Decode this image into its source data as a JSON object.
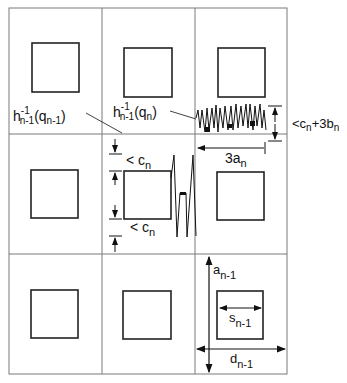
{
  "diagram": {
    "grid": {
      "rows": 3,
      "cols": 3,
      "line_color": "#7a7a7a",
      "square_color": "#222222"
    },
    "labels": {
      "h_prev": {
        "base": "h",
        "sup": "-1",
        "sub": "n-1",
        "arg": "(q",
        "arg_sub": "n-1",
        "close": ")"
      },
      "h_curr": {
        "base": "h",
        "sup": "-1",
        "sub": "n-1",
        "arg": "(q",
        "arg_sub": "n",
        "close": ")"
      },
      "height_bound": {
        "prefix": "<c",
        "sub1": "n",
        "mid": "+3b",
        "sub2": "n"
      },
      "width_3a": {
        "main": "3a",
        "sub": "n"
      },
      "cn_top": {
        "main": "< c",
        "sub": "n"
      },
      "cn_bottom": {
        "main": "< c",
        "sub": "n"
      },
      "a_prev": {
        "main": "a",
        "sub": "n-1"
      },
      "s_prev": {
        "main": "s",
        "sub": "n-1"
      },
      "d_prev": {
        "main": "d",
        "sub": "n-1"
      }
    }
  }
}
